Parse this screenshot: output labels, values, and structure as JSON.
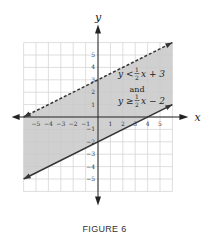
{
  "chart_data": {
    "type": "area",
    "title": "",
    "caption": "FIGURE 6",
    "xlabel": "x",
    "ylabel": "y",
    "xlim": [
      -6,
      6
    ],
    "ylim": [
      -6,
      6
    ],
    "grid": true,
    "x_ticks": [
      -5,
      -4,
      -3,
      -2,
      -1,
      1,
      2,
      3,
      4,
      5
    ],
    "y_ticks": [
      -5,
      -4,
      -3,
      -2,
      -1,
      1,
      2,
      3,
      4,
      5
    ],
    "x_tick_labels": [
      "−5",
      "−4",
      "−3",
      "−2",
      "−1",
      "1",
      "2",
      "3",
      "4",
      "5"
    ],
    "y_tick_labels": [
      "−5",
      "−4",
      "−3",
      "−2",
      "−1",
      "1",
      "2",
      "3",
      "4",
      "5"
    ],
    "series": [
      {
        "name": "y < 1/2 x + 3",
        "slope": 0.5,
        "intercept": 3,
        "style": "dashed",
        "x": [
          -6,
          6
        ],
        "y": [
          0,
          6
        ]
      },
      {
        "name": "y ≥ 1/2 x − 2",
        "slope": 0.5,
        "intercept": -2,
        "style": "solid",
        "x": [
          -6,
          6
        ],
        "y": [
          -5,
          1
        ]
      }
    ],
    "shaded_region": "between lines",
    "annotation": {
      "line1": {
        "lhs": "y <",
        "num": "1",
        "den": "2",
        "rhs": "x + 3"
      },
      "conj": "and",
      "line2": {
        "lhs": "y ≥",
        "num": "1",
        "den": "2",
        "rhs": "x − 2"
      }
    }
  },
  "colors": {
    "shade": "#c8c8c8",
    "grid": "#d6d6d6",
    "line": "#333333",
    "axis": "#222222"
  }
}
